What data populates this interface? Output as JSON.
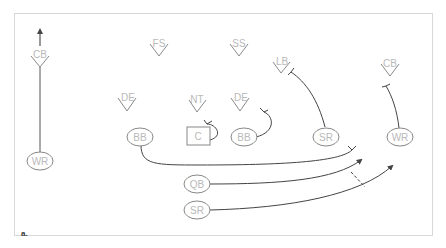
{
  "figure": {
    "caption": "a.",
    "frame_color": "#d8d8d8",
    "line_color": "#444444",
    "label_color": "#b9b9b9"
  },
  "defense": [
    {
      "id": "cb_left",
      "label": "CB"
    },
    {
      "id": "fs",
      "label": "FS"
    },
    {
      "id": "ss",
      "label": "SS"
    },
    {
      "id": "lb",
      "label": "LB"
    },
    {
      "id": "cb_right",
      "label": "CB"
    },
    {
      "id": "de_left",
      "label": "DE"
    },
    {
      "id": "nt",
      "label": "NT"
    },
    {
      "id": "de_right",
      "label": "DE"
    }
  ],
  "offense": [
    {
      "id": "wr_left",
      "label": "WR"
    },
    {
      "id": "bb_left",
      "label": "BB"
    },
    {
      "id": "center",
      "label": "C"
    },
    {
      "id": "bb_right",
      "label": "BB"
    },
    {
      "id": "sr_right",
      "label": "SR"
    },
    {
      "id": "wr_right",
      "label": "WR"
    },
    {
      "id": "qb",
      "label": "QB"
    },
    {
      "id": "sr_back",
      "label": "SR"
    }
  ],
  "routes": [
    {
      "from": "WR",
      "action": "vertical route, CB drops deep",
      "type": "arrow"
    },
    {
      "from": "C",
      "action": "block NT",
      "type": "block"
    },
    {
      "from": "BB",
      "action": "block DE",
      "type": "block"
    },
    {
      "from": "SR",
      "action": "block LB",
      "type": "block"
    },
    {
      "from": "WR",
      "action": "block CB",
      "type": "block"
    },
    {
      "from": "BB",
      "action": "lead block to right",
      "type": "block"
    },
    {
      "from": "QB",
      "action": "sweep right",
      "type": "arrow"
    },
    {
      "from": "SR",
      "action": "sweep right, pitch from QB",
      "type": "arrow"
    },
    {
      "from": "QB",
      "to": "SR",
      "action": "pitch",
      "type": "dashed"
    }
  ]
}
